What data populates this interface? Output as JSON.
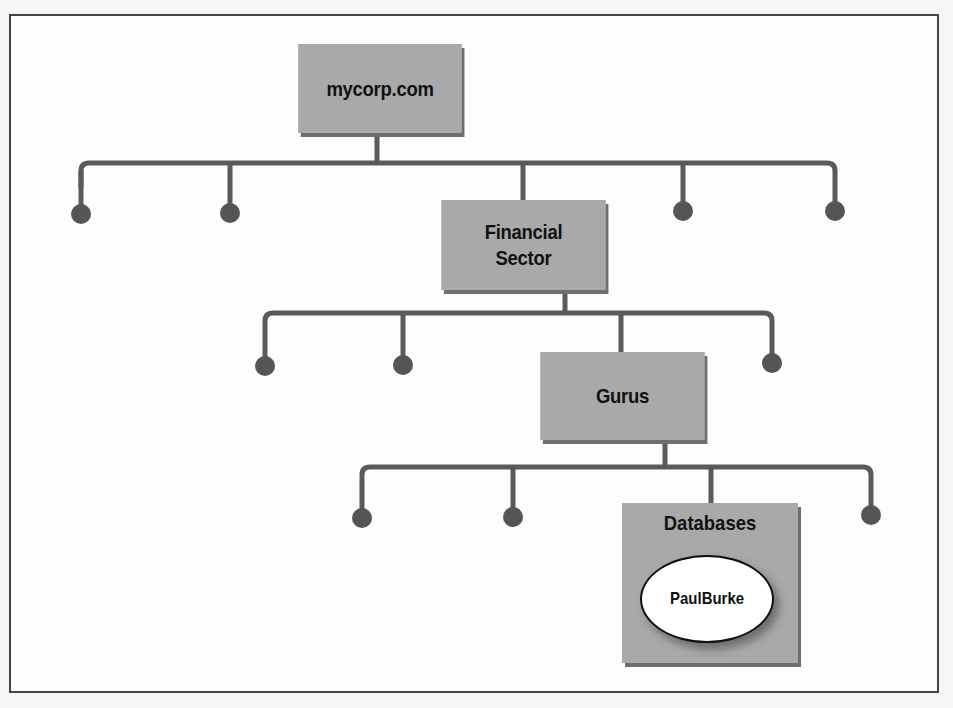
{
  "diagram": {
    "type": "hierarchy-tree",
    "colors": {
      "node_fill": "#a9a9a9",
      "node_shadow": "#6e6e6e",
      "connector": "#555555",
      "leaf_dot": "#555555",
      "user_fill": "#ffffff"
    },
    "root": {
      "label": "mycorp.com"
    },
    "level1": {
      "label_line1": "Financial",
      "label_line2": "Sector",
      "unlabeled_siblings": 4
    },
    "level2": {
      "label": "Gurus",
      "unlabeled_siblings": 3
    },
    "level3": {
      "label": "Databases",
      "unlabeled_siblings": 3,
      "member": {
        "label": "PaulBurke"
      }
    }
  }
}
